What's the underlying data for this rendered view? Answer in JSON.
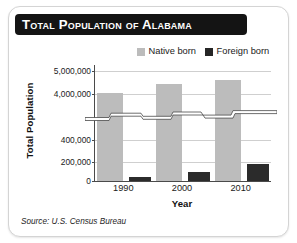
{
  "card": {
    "title": "Total Population of Alabama",
    "source": "Source: U.S. Census Bureau"
  },
  "legend": {
    "native_label": "Native born",
    "foreign_label": "Foreign born",
    "native_color": "#bcbcbc",
    "foreign_color": "#2b2b2b"
  },
  "axes": {
    "y_title": "Total Population",
    "x_title": "Year",
    "y_tick_labels": [
      "5,000,000",
      "4,000,000",
      "400,000",
      "200,000",
      "0"
    ],
    "x_tick_labels": [
      "1990",
      "2000",
      "2010"
    ]
  },
  "chart_data": {
    "type": "bar",
    "title": "Total Population of Alabama",
    "subtitle": "",
    "xlabel": "Year",
    "ylabel": "Total Population",
    "categories": [
      "1990",
      "2000",
      "2010"
    ],
    "series": [
      {
        "name": "Native born",
        "color": "#bcbcbc",
        "values": [
          4040000,
          4430000,
          4630000
        ]
      },
      {
        "name": "Foreign born",
        "color": "#2b2b2b",
        "values": [
          44000,
          88000,
          169000
        ]
      }
    ],
    "axis_break": true,
    "axis_break_note": "y-axis broken between 400,000 and 4,000,000",
    "y_tick_values": [
      5000000,
      4000000,
      400000,
      200000,
      0
    ],
    "y_tick_labels": [
      "5,000,000",
      "4,000,000",
      "400,000",
      "200,000",
      "0"
    ],
    "ylim_lower_segment": [
      0,
      400000
    ],
    "ylim_upper_segment": [
      4000000,
      5000000
    ],
    "grid": true,
    "legend_position": "top-right",
    "source": "Source: U.S. Census Bureau"
  }
}
